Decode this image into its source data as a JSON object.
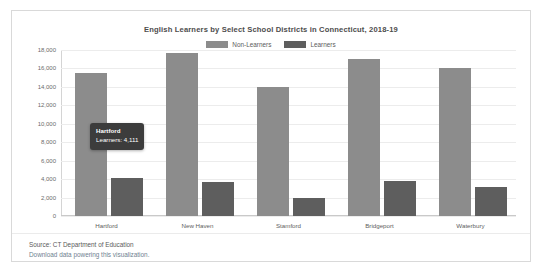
{
  "chart_data": {
    "type": "bar",
    "title": "English Learners by Select School Districts in Connecticut, 2018-19",
    "xlabel": "",
    "ylabel": "",
    "ylim": [
      0,
      18000
    ],
    "grid": true,
    "legend_position": "top-center",
    "categories": [
      "Hartford",
      "New Haven",
      "Stamford",
      "Bridgeport",
      "Waterbury"
    ],
    "ytick_labels": [
      "18,000",
      "16,000",
      "14,000",
      "12,000",
      "10,000",
      "8,000",
      "6,000",
      "4,000",
      "2,000",
      "0"
    ],
    "ytick_values": [
      18000,
      16000,
      14000,
      12000,
      10000,
      8000,
      6000,
      4000,
      2000,
      0
    ],
    "series": [
      {
        "name": "Non-Learners",
        "color": "#8c8c8c",
        "values": [
          15500,
          17700,
          14000,
          17000,
          16000
        ]
      },
      {
        "name": "Learners",
        "color": "#5e5e5e",
        "values": [
          4111,
          3700,
          2000,
          3800,
          3100
        ]
      }
    ]
  },
  "tooltip": {
    "title": "Hartford",
    "value_line": "Learners: 4,111"
  },
  "footer": {
    "source": "Source: CT Department of Education",
    "download_link": "Download data powering this visualization."
  }
}
